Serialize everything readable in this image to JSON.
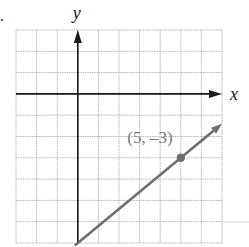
{
  "problem_marker": ".",
  "colors": {
    "grid": "#b8b8b8",
    "axis": "#1a1a1a",
    "line": "#6e6e6e",
    "point": "#6e6e6e",
    "label": "#7a7a7a",
    "background": "#ffffff"
  },
  "chart_data": {
    "type": "line",
    "title": "",
    "xlabel": "x",
    "ylabel": "y",
    "xlim": [
      -3,
      7
    ],
    "ylim": [
      -7,
      3
    ],
    "grid": true,
    "tick_labels": false,
    "axes_arrows": true,
    "series": [
      {
        "name": "line",
        "equation": "y = (4/5)x - 7",
        "x": [
          0,
          7
        ],
        "y": [
          -7,
          -1.4
        ],
        "arrow_end": true
      }
    ],
    "points": [
      {
        "x": 5,
        "y": -3,
        "label": "(5, –3)"
      }
    ],
    "annotations": [
      {
        "text": "(5, –3)",
        "x": 3.5,
        "y": -2.3
      }
    ]
  }
}
